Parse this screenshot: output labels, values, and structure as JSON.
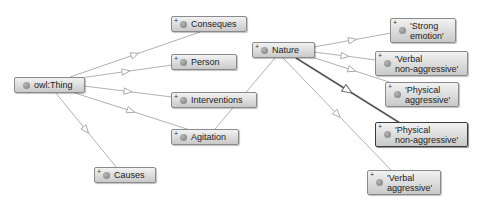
{
  "diagram": {
    "root": {
      "id": "owl_thing",
      "label": "owl:Thing"
    },
    "nodes": [
      {
        "id": "owl_thing",
        "label": "owl:Thing",
        "x": 14,
        "y": 77,
        "w": 71,
        "h": 16,
        "expandable": false,
        "selected": false
      },
      {
        "id": "conseques",
        "label": "Conseques",
        "x": 171,
        "y": 16,
        "w": 76,
        "h": 16,
        "expandable": true,
        "selected": false
      },
      {
        "id": "person",
        "label": "Person",
        "x": 171,
        "y": 54,
        "w": 66,
        "h": 16,
        "expandable": true,
        "selected": false
      },
      {
        "id": "interventions",
        "label": "Interventions",
        "x": 171,
        "y": 92,
        "w": 86,
        "h": 16,
        "expandable": true,
        "selected": false
      },
      {
        "id": "agitation",
        "label": "Agitation",
        "x": 171,
        "y": 129,
        "w": 68,
        "h": 16,
        "expandable": true,
        "selected": false
      },
      {
        "id": "causes",
        "label": "Causes",
        "x": 94,
        "y": 167,
        "w": 62,
        "h": 16,
        "expandable": true,
        "selected": false
      },
      {
        "id": "nature",
        "label": "Nature",
        "x": 252,
        "y": 42,
        "w": 63,
        "h": 16,
        "expandable": true,
        "selected": false
      },
      {
        "id": "strong_emotion",
        "label": "'Strong\nemotion'",
        "x": 390,
        "y": 18,
        "w": 66,
        "h": 25,
        "expandable": true,
        "selected": false
      },
      {
        "id": "verbal_non_aggressive",
        "label": "'Verbal\nnon-aggressive'",
        "x": 375,
        "y": 51,
        "w": 93,
        "h": 25,
        "expandable": true,
        "selected": false
      },
      {
        "id": "physical_aggressive",
        "label": "'Physical\naggressive'",
        "x": 385,
        "y": 82,
        "w": 74,
        "h": 25,
        "expandable": true,
        "selected": false
      },
      {
        "id": "physical_non_aggressive",
        "label": "'Physical\nnon-aggressive'",
        "x": 375,
        "y": 122,
        "w": 93,
        "h": 25,
        "expandable": true,
        "selected": true
      },
      {
        "id": "verbal_aggressive",
        "label": "'Verbal\naggressive'",
        "x": 367,
        "y": 170,
        "w": 74,
        "h": 25,
        "expandable": true,
        "selected": false
      }
    ],
    "edges": [
      {
        "from": "owl_thing",
        "to": "conseques",
        "x1": 70,
        "y1": 77,
        "x2": 200,
        "y2": 32,
        "type": "subclass"
      },
      {
        "from": "owl_thing",
        "to": "person",
        "x1": 80,
        "y1": 78,
        "x2": 172,
        "y2": 65,
        "type": "subclass"
      },
      {
        "from": "owl_thing",
        "to": "interventions",
        "x1": 84,
        "y1": 86,
        "x2": 172,
        "y2": 97,
        "type": "subclass"
      },
      {
        "from": "owl_thing",
        "to": "agitation",
        "x1": 72,
        "y1": 92,
        "x2": 190,
        "y2": 130,
        "type": "subclass"
      },
      {
        "from": "owl_thing",
        "to": "causes",
        "x1": 55,
        "y1": 92,
        "x2": 117,
        "y2": 168,
        "type": "subclass"
      },
      {
        "from": "agitation",
        "to": "nature",
        "x1": 215,
        "y1": 129,
        "x2": 275,
        "y2": 58,
        "type": "plain"
      },
      {
        "from": "nature",
        "to": "strong_emotion",
        "x1": 314,
        "y1": 47,
        "x2": 391,
        "y2": 33,
        "type": "subclass"
      },
      {
        "from": "nature",
        "to": "verbal_non_aggressive",
        "x1": 314,
        "y1": 52,
        "x2": 376,
        "y2": 60,
        "type": "subclass"
      },
      {
        "from": "nature",
        "to": "physical_aggressive",
        "x1": 312,
        "y1": 57,
        "x2": 392,
        "y2": 83,
        "type": "subclass"
      },
      {
        "from": "nature",
        "to": "physical_non_aggressive",
        "x1": 296,
        "y1": 58,
        "x2": 400,
        "y2": 123,
        "type": "selected"
      },
      {
        "from": "nature",
        "to": "verbal_aggressive",
        "x1": 283,
        "y1": 58,
        "x2": 392,
        "y2": 171,
        "type": "subclass"
      }
    ],
    "expand_glyph": "+",
    "colors": {
      "edge": "#a8a8a8",
      "edge_selected": "#555555",
      "node_border": "#8a8a8a",
      "node_border_selected": "#3c3c3c",
      "dot": "#8c8c8c"
    }
  }
}
